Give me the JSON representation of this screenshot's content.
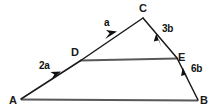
{
  "diagram": {
    "type": "vector-triangle",
    "background_color": "#ffffff",
    "stroke_color": "#1a1a1a",
    "base_line_color": "#595959",
    "vertices": [
      {
        "id": "A",
        "label": "A",
        "x": 21,
        "y": 99,
        "label_x": 9,
        "label_y": 95
      },
      {
        "id": "B",
        "label": "B",
        "x": 198,
        "y": 100,
        "label_x": 200,
        "label_y": 95
      },
      {
        "id": "C",
        "label": "C",
        "x": 143,
        "y": 18,
        "label_x": 139,
        "label_y": 3
      },
      {
        "id": "D",
        "label": "D",
        "x": 80,
        "y": 61,
        "label_x": 71,
        "label_y": 47
      },
      {
        "id": "E",
        "label": "E",
        "x": 177,
        "y": 58,
        "label_x": 178,
        "label_y": 52
      }
    ],
    "segments": [
      {
        "id": "AD",
        "from": "A",
        "to": "D",
        "style": "vector",
        "direction": "forward"
      },
      {
        "id": "DC",
        "from": "D",
        "to": "C",
        "style": "vector",
        "direction": "forward"
      },
      {
        "id": "CE",
        "from": "C",
        "to": "E",
        "style": "vector",
        "direction": "backward"
      },
      {
        "id": "EB",
        "from": "E",
        "to": "B",
        "style": "vector",
        "direction": "backward"
      },
      {
        "id": "DE",
        "from": "D",
        "to": "E",
        "style": "plain-thick",
        "direction": "none"
      },
      {
        "id": "AB",
        "from": "A",
        "to": "B",
        "style": "plain-thick",
        "direction": "none"
      }
    ],
    "vector_labels": [
      {
        "id": "2a",
        "text": "2a",
        "segment": "AD",
        "x": 39,
        "y": 61
      },
      {
        "id": "a",
        "text": "a",
        "segment": "DC",
        "x": 104,
        "y": 18
      },
      {
        "id": "3b",
        "text": "3b",
        "segment": "CE",
        "x": 162,
        "y": 24
      },
      {
        "id": "6b",
        "text": "6b",
        "segment": "EB",
        "x": 191,
        "y": 64
      }
    ]
  }
}
